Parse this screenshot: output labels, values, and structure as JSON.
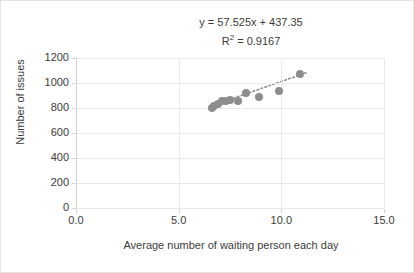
{
  "chart_data": {
    "type": "scatter",
    "title": "",
    "xlabel": "Average number of waiting person each day",
    "ylabel": "Number of issues",
    "xlim": [
      0.0,
      15.0
    ],
    "ylim": [
      0,
      1200
    ],
    "xticks": [
      "0.0",
      "5.0",
      "10.0",
      "15.0"
    ],
    "xtick_values": [
      0.0,
      5.0,
      10.0,
      15.0
    ],
    "yticks": [
      "0",
      "200",
      "400",
      "600",
      "800",
      "1000",
      "1200"
    ],
    "ytick_values": [
      0,
      200,
      400,
      600,
      800,
      1000,
      1200
    ],
    "grid": true,
    "legend": false,
    "series": [
      {
        "name": "Issues vs waiting persons",
        "marker": "circle",
        "color": "#8d8d8d",
        "points": [
          {
            "x": 6.6,
            "y": 800
          },
          {
            "x": 6.7,
            "y": 820
          },
          {
            "x": 6.9,
            "y": 835
          },
          {
            "x": 7.1,
            "y": 855
          },
          {
            "x": 7.3,
            "y": 860
          },
          {
            "x": 7.5,
            "y": 865
          },
          {
            "x": 7.9,
            "y": 858
          },
          {
            "x": 8.3,
            "y": 920
          },
          {
            "x": 8.9,
            "y": 885
          },
          {
            "x": 9.9,
            "y": 940
          },
          {
            "x": 10.9,
            "y": 1070
          }
        ]
      }
    ],
    "trendline": {
      "type": "linear",
      "style": "dotted",
      "color": "#8d8d8d",
      "slope": 57.525,
      "intercept": 437.35,
      "r_squared": 0.9167,
      "x_start": 6.5,
      "x_end": 11.2
    },
    "annotations": {
      "equation": "y = 57.525x + 437.35",
      "r_squared_prefix": "R",
      "r_squared_sup": "2",
      "r_squared_value": " = 0.9167"
    },
    "colors": {
      "marker": "#8d8d8d",
      "gridline": "#e9e9e9",
      "axis": "#d2d2d2",
      "text": "#3b3b3b",
      "background": "#ffffff"
    }
  }
}
